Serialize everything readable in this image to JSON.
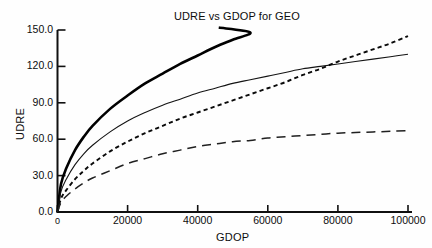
{
  "chart_data": {
    "type": "line",
    "title": "UDRE vs GDOP for GEO",
    "xlabel": "GDOP",
    "ylabel": "UDRE",
    "xlim": [
      0,
      100000
    ],
    "ylim": [
      0,
      150
    ],
    "grid": false,
    "legend_position": "none",
    "xticks": [
      0,
      20000,
      40000,
      60000,
      80000,
      100000
    ],
    "xtick_labels": [
      "0",
      "20000",
      "40000",
      "60000",
      "80000",
      "100000"
    ],
    "yticks": [
      0,
      30,
      60,
      90,
      120,
      150
    ],
    "ytick_labels": [
      "0.0",
      "30.0",
      "60.0",
      "90.0",
      "120.0",
      "150.0"
    ],
    "x": [
      0,
      1000,
      2500,
      5000,
      7500,
      10000,
      15000,
      20000,
      25000,
      30000,
      35000,
      40000,
      45000,
      50000,
      55000,
      60000,
      65000,
      70000,
      75000,
      80000,
      85000,
      90000,
      95000,
      100000
    ],
    "series": [
      {
        "name": "curve-thick-solid",
        "style": "solid-thick",
        "color": "#000000",
        "values": [
          0,
          23,
          36,
          51,
          62,
          71,
          85,
          96,
          106,
          114,
          122,
          129,
          136,
          142,
          148,
          null,
          null,
          null,
          null,
          null,
          null,
          null,
          null,
          null
        ],
        "x_end": 46000,
        "y_end": 152
      },
      {
        "name": "curve-thin-solid",
        "style": "solid-thin",
        "color": "#141414",
        "values": [
          0,
          17,
          27,
          39,
          48,
          55,
          66,
          75,
          82,
          88,
          93,
          98,
          102,
          106,
          109,
          112,
          115,
          118,
          120,
          122,
          124,
          126,
          128,
          130
        ]
      },
      {
        "name": "curve-short-dashed",
        "style": "dotted",
        "color": "#0a0a0a",
        "values": [
          0,
          11,
          18,
          27,
          34,
          40,
          50,
          58,
          65,
          71,
          77,
          82,
          87,
          92,
          97,
          102,
          107,
          113,
          118,
          124,
          129,
          134,
          139,
          145
        ]
      },
      {
        "name": "curve-long-dashed",
        "style": "dashed",
        "color": "#202020",
        "values": [
          0,
          8,
          13,
          19,
          24,
          28,
          34,
          40,
          44,
          48,
          51,
          54,
          56,
          58,
          59,
          61,
          62,
          63,
          64,
          65,
          65.5,
          66,
          66.5,
          67
        ]
      }
    ]
  },
  "figure": {
    "title": "UDRE vs GDOP for GEO",
    "x_axis_title": "GDOP",
    "y_axis_title": "UDRE",
    "background_color": "#ffffff",
    "axis_color": "#101010"
  }
}
